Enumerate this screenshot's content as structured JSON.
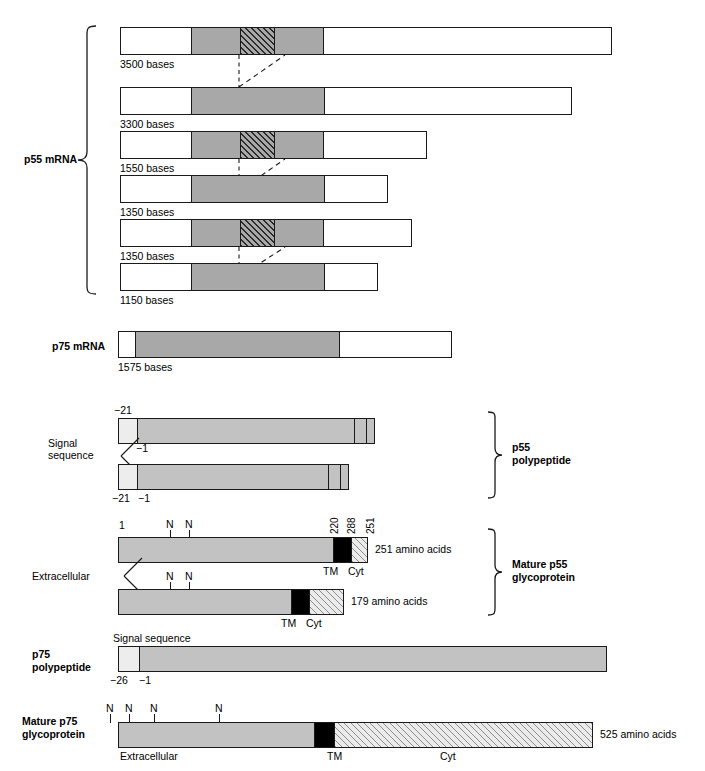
{
  "figure": {
    "title": "",
    "groups": {
      "p55_mrna": "p55 mRNA",
      "p75_mrna": "p75 mRNA",
      "p55_polypeptide_l1": "p55",
      "p55_polypeptide_l2": "polypeptide",
      "mature_p55_l1": "Mature p55",
      "mature_p55_l2": "glycoprotein",
      "p75_polypeptide_l1": "p75",
      "p75_polypeptide_l2": "polypeptide",
      "mature_p75_l1": "Mature p75",
      "mature_p75_l2": "glycoprotein"
    },
    "mrna_p55": [
      {
        "length_label": "3500 bases",
        "bases": 3500,
        "has_exon": true
      },
      {
        "length_label": "3300 bases",
        "bases": 3300,
        "has_exon": false
      },
      {
        "length_label": "1550 bases",
        "bases": 1550,
        "has_exon": true
      },
      {
        "length_label": "1350 bases",
        "bases": 1350,
        "has_exon": false
      },
      {
        "length_label": "1350 bases",
        "bases": 1350,
        "has_exon": true
      },
      {
        "length_label": "1150 bases",
        "bases": 1150,
        "has_exon": false
      }
    ],
    "mrna_p75": {
      "length_label": "1575 bases",
      "bases": 1575
    },
    "p55_polypeptide": {
      "signal_label_l1": "Signal",
      "signal_label_l2": "sequence",
      "start_upper": "−21",
      "end_upper": "−1",
      "start_lower": "−21",
      "end_lower": "−1"
    },
    "mature_p55": {
      "n_terminus": "1",
      "glyc_marker": "N",
      "boundary_220": "220",
      "boundary_288": "288",
      "boundary_251": "251",
      "tm_label": "TM",
      "cyt_label": "Cyt",
      "extracellular_label": "Extracellular",
      "size_upper": "251 amino acids",
      "size_lower": "179 amino acids"
    },
    "p75_polypeptide": {
      "signal_label": "Signal sequence",
      "start": "−26",
      "end": "−1"
    },
    "mature_p75": {
      "glyc_marker": "N",
      "extracellular_label": "Extracellular",
      "tm_label": "TM",
      "cyt_label": "Cyt",
      "size": "525 amino acids"
    },
    "colors": {
      "outline": "#1a1a1a",
      "coding_gray": "#a8a8a8",
      "protein_gray": "#c2c2c2",
      "signal_light": "#ededed",
      "transmembrane_black": "#000000",
      "background": "#ffffff"
    }
  }
}
